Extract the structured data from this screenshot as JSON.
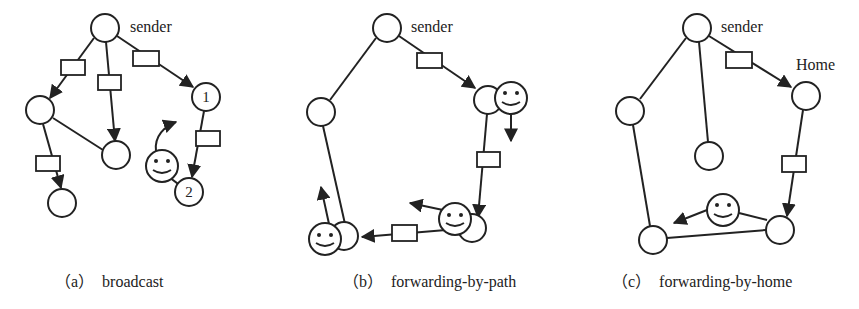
{
  "figure": {
    "panels": [
      {
        "id": "a",
        "caption_prefix": "（a）",
        "caption": "broadcast",
        "sender_label": "sender",
        "node_numbers": [
          "1",
          "2"
        ]
      },
      {
        "id": "b",
        "caption_prefix": "（b）",
        "caption": "forwarding-by-path",
        "sender_label": "sender"
      },
      {
        "id": "c",
        "caption_prefix": "（c）",
        "caption": "forwarding-by-home",
        "sender_label": "sender",
        "home_label": "Home"
      }
    ],
    "legend_semantics": {
      "circle": "node",
      "rectangle": "message",
      "smiley": "mobile-user"
    },
    "colors": {
      "stroke": "#222222",
      "background": "#ffffff"
    }
  }
}
